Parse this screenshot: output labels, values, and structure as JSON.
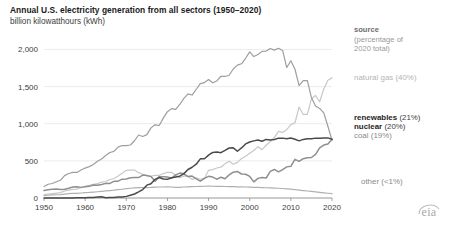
{
  "header": {
    "title": "Annual U.S. electricity generation from all sectors (1950–2020)",
    "subtitle": "billion kilowatthours (kWh)"
  },
  "legend": {
    "title": "source",
    "subtitle": "(percentage of\n2020 total)",
    "subtitle_line1": "(percentage of",
    "subtitle_line2": "2020 total)",
    "entries": [
      {
        "label": "natural gas",
        "pct": "(40%)",
        "color": "#c8c8c8"
      },
      {
        "label": "renewables",
        "pct": "(21%)",
        "color": "#8f8f8f"
      },
      {
        "label": "nuclear",
        "pct": "(20%)",
        "color": "#4a4a4a"
      },
      {
        "label": "coal",
        "pct": "(19%)",
        "color": "#9e9e9e"
      },
      {
        "label": "other",
        "pct": "(<1%)",
        "color": "#b0b0b0"
      }
    ]
  },
  "branding": {
    "logo_text": "eia"
  },
  "chart_data": {
    "type": "line",
    "title": "Annual U.S. electricity generation from all sectors (1950–2020)",
    "subtitle": "billion kilowatthours (kWh)",
    "xlabel": "",
    "ylabel": "billion kilowatthours (kWh)",
    "xlim": [
      1950,
      2020
    ],
    "ylim": [
      0,
      2100
    ],
    "yticks": [
      0,
      500,
      1000,
      1500,
      2000
    ],
    "ytick_labels": [
      "0",
      "500",
      "1,000",
      "1,500",
      "2,000"
    ],
    "xticks": [
      1950,
      1960,
      1970,
      1980,
      1990,
      2000,
      2010,
      2020
    ],
    "xtick_labels": [
      "1950",
      "1960",
      "1970",
      "1980",
      "1990",
      "2000",
      "2010",
      "2020"
    ],
    "grid": "horizontal",
    "legend_position": "right",
    "x": [
      1950,
      1951,
      1952,
      1953,
      1954,
      1955,
      1956,
      1957,
      1958,
      1959,
      1960,
      1961,
      1962,
      1963,
      1964,
      1965,
      1966,
      1967,
      1968,
      1969,
      1970,
      1971,
      1972,
      1973,
      1974,
      1975,
      1976,
      1977,
      1978,
      1979,
      1980,
      1981,
      1982,
      1983,
      1984,
      1985,
      1986,
      1987,
      1988,
      1989,
      1990,
      1991,
      1992,
      1993,
      1994,
      1995,
      1996,
      1997,
      1998,
      1999,
      2000,
      2001,
      2002,
      2003,
      2004,
      2005,
      2006,
      2007,
      2008,
      2009,
      2010,
      2011,
      2012,
      2013,
      2014,
      2015,
      2016,
      2017,
      2018,
      2019,
      2020
    ],
    "series": [
      {
        "name": "coal",
        "label": "coal (19%)",
        "color": "#9e9e9e",
        "percent_2020": 19,
        "values": [
          155,
          185,
          195,
          219,
          239,
          301,
          330,
          346,
          344,
          376,
          403,
          422,
          450,
          494,
          526,
          571,
          613,
          627,
          685,
          706,
          704,
          713,
          771,
          848,
          828,
          853,
          944,
          985,
          976,
          1075,
          1162,
          1203,
          1192,
          1259,
          1342,
          1402,
          1386,
          1464,
          1540,
          1554,
          1594,
          1551,
          1576,
          1639,
          1636,
          1653,
          1737,
          1788,
          1807,
          1881,
          1966,
          1904,
          1933,
          1974,
          1978,
          2013,
          1991,
          2016,
          1986,
          1756,
          1847,
          1733,
          1514,
          1581,
          1582,
          1352,
          1239,
          1206,
          1146,
          966,
          774
        ]
      },
      {
        "name": "natural gas",
        "label": "natural gas (40%)",
        "color": "#c8c8c8",
        "percent_2020": 40,
        "values": [
          45,
          53,
          59,
          65,
          73,
          95,
          107,
          116,
          120,
          141,
          158,
          169,
          183,
          194,
          213,
          222,
          249,
          263,
          297,
          333,
          373,
          374,
          376,
          341,
          320,
          300,
          295,
          306,
          305,
          329,
          346,
          346,
          305,
          274,
          297,
          292,
          248,
          273,
          253,
          267,
          373,
          382,
          404,
          415,
          460,
          496,
          455,
          479,
          531,
          563,
          601,
          639,
          691,
          650,
          710,
          761,
          816,
          897,
          883,
          921,
          988,
          1013,
          1225,
          1125,
          1126,
          1335,
          1380,
          1296,
          1468,
          1586,
          1617
        ]
      },
      {
        "name": "nuclear",
        "label": "nuclear (20%)",
        "color": "#4a4a4a",
        "percent_2020": 20,
        "values": [
          0,
          0,
          0,
          0,
          0,
          0,
          0,
          1,
          2,
          2,
          5,
          6,
          8,
          12,
          16,
          4,
          6,
          8,
          13,
          14,
          22,
          38,
          54,
          83,
          114,
          173,
          191,
          251,
          276,
          255,
          251,
          273,
          283,
          294,
          328,
          384,
          414,
          455,
          527,
          529,
          577,
          613,
          619,
          610,
          640,
          673,
          675,
          629,
          674,
          728,
          754,
          769,
          780,
          764,
          789,
          782,
          787,
          806,
          806,
          799,
          807,
          790,
          769,
          789,
          797,
          797,
          806,
          805,
          807,
          809,
          790
        ]
      },
      {
        "name": "renewables",
        "label": "renewables (21%)",
        "color": "#8f8f8f",
        "percent_2020": 21,
        "values": [
          101,
          111,
          117,
          120,
          113,
          117,
          131,
          148,
          150,
          143,
          150,
          157,
          176,
          172,
          181,
          197,
          196,
          225,
          227,
          254,
          255,
          272,
          276,
          275,
          309,
          303,
          288,
          225,
          287,
          286,
          284,
          266,
          311,
          335,
          325,
          288,
          295,
          257,
          226,
          265,
          292,
          282,
          253,
          280,
          260,
          311,
          348,
          357,
          323,
          320,
          290,
          217,
          264,
          276,
          269,
          358,
          384,
          352,
          382,
          419,
          427,
          521,
          494,
          529,
          541,
          545,
          588,
          676,
          713,
          728,
          792
        ]
      },
      {
        "name": "other",
        "label": "other (<1%)",
        "color": "#b0b0b0",
        "percent_2020": 0.5,
        "values": [
          33,
          38,
          41,
          44,
          46,
          53,
          58,
          62,
          63,
          67,
          72,
          75,
          80,
          84,
          89,
          95,
          100,
          105,
          112,
          118,
          125,
          131,
          137,
          140,
          141,
          140,
          142,
          146,
          148,
          148,
          150,
          148,
          143,
          142,
          148,
          150,
          153,
          155,
          157,
          158,
          160,
          158,
          157,
          156,
          155,
          154,
          152,
          150,
          149,
          148,
          147,
          144,
          142,
          140,
          138,
          136,
          133,
          131,
          128,
          124,
          120,
          113,
          106,
          100,
          94,
          88,
          82,
          76,
          70,
          64,
          58
        ]
      }
    ]
  }
}
